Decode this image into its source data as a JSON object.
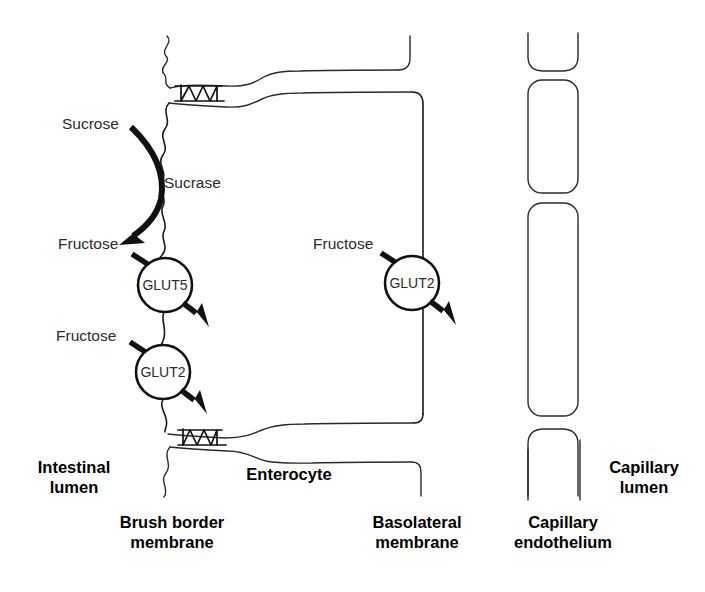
{
  "figure": {
    "stroke_color": "#111111",
    "label_color": "#2b2b2b",
    "background": "#ffffff"
  },
  "substrates": {
    "sucrose": "Sucrose",
    "fructose_lumen_upper": "Fructose",
    "fructose_lumen_lower": "Fructose",
    "fructose_cytosol": "Fructose"
  },
  "enzymes": {
    "sucrase": "Sucrase"
  },
  "transporters": [
    {
      "name": "GLUT5",
      "location": "brush-border-membrane"
    },
    {
      "name": "GLUT2",
      "location": "brush-border-membrane"
    },
    {
      "name": "GLUT2",
      "location": "basolateral-membrane"
    }
  ],
  "transporter_labels": {
    "glut5_brush_border": "GLUT5",
    "glut2_brush_border": "GLUT2",
    "glut2_basolateral": "GLUT2"
  },
  "compartments": {
    "intestinal_lumen_line1": "Intestinal",
    "intestinal_lumen_line2": "lumen",
    "enterocyte": "Enterocyte",
    "capillary_lumen_line1": "Capillary",
    "capillary_lumen_line2": "lumen"
  },
  "membranes": {
    "brush_border_line1": "Brush border",
    "brush_border_line2": "membrane",
    "basolateral_line1": "Basolateral",
    "basolateral_line2": "membrane",
    "capillary_endothelium_line1": "Capillary",
    "capillary_endothelium_line2": "endothelium"
  }
}
